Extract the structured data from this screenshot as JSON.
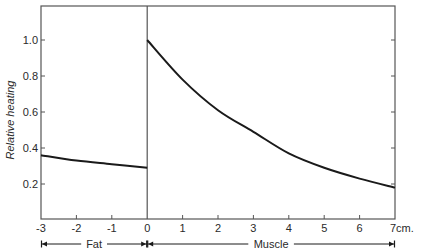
{
  "chart_data": {
    "type": "line",
    "title": "",
    "xlabel": "",
    "ylabel": "Relative heating",
    "xlim": [
      -3,
      7
    ],
    "ylim": [
      0,
      1.2
    ],
    "x_unit_label": "7cm.",
    "xticks": [
      -3,
      -2,
      -1,
      0,
      1,
      2,
      3,
      4,
      5,
      6,
      7
    ],
    "xtick_labels": [
      "-3",
      "-2",
      "-1",
      "0",
      "1",
      "2",
      "3",
      "4",
      "5",
      "6",
      "7cm."
    ],
    "yticks": [
      0.2,
      0.4,
      0.6,
      0.8,
      1.0
    ],
    "ytick_labels": [
      "0.2",
      "0.4",
      "0.6",
      "0.8",
      "1.0"
    ],
    "grid": false,
    "legend": null,
    "series": [
      {
        "name": "Fat",
        "x": [
          -3,
          -2,
          -1,
          0
        ],
        "values": [
          0.36,
          0.33,
          0.31,
          0.29
        ]
      },
      {
        "name": "Muscle",
        "x": [
          0,
          1,
          2,
          3,
          4,
          5,
          6,
          7
        ],
        "values": [
          1.0,
          0.78,
          0.61,
          0.49,
          0.37,
          0.29,
          0.23,
          0.18
        ]
      }
    ],
    "regions": [
      {
        "label": "Fat",
        "from": -3,
        "to": 0
      },
      {
        "label": "Muscle",
        "from": 0,
        "to": 7
      }
    ],
    "colors": {
      "line": "#1a1a1a",
      "axis": "#555555",
      "text": "#2a2a2a"
    }
  }
}
